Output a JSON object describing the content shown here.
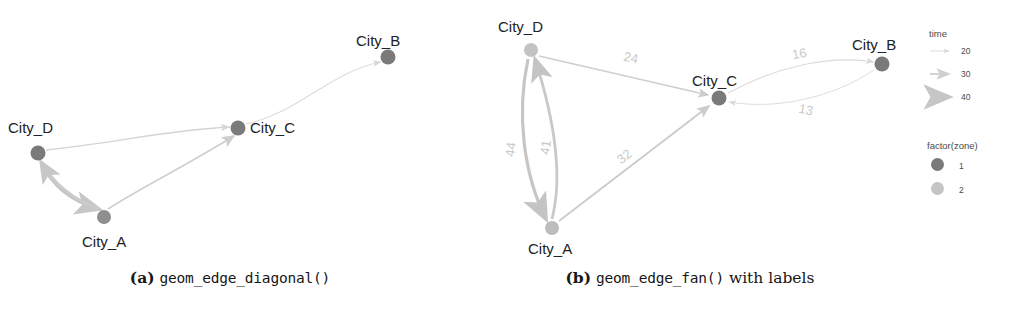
{
  "figure": {
    "background": "#ffffff",
    "panels": [
      {
        "id": "a",
        "caption_prefix": "(a)",
        "caption_code": "geom_edge_diagonal()",
        "caption_suffix": "",
        "nodes": [
          {
            "name": "City_B",
            "label": "City_B",
            "x": 388,
            "y": 57,
            "zone": 1,
            "color": "#7a7a7a",
            "label_x": 356,
            "label_y": 32
          },
          {
            "name": "City_C",
            "label": "City_C",
            "x": 238,
            "y": 128,
            "zone": 1,
            "color": "#7a7a7a",
            "label_x": 250,
            "label_y": 119
          },
          {
            "name": "City_D",
            "label": "City_D",
            "x": 38,
            "y": 153,
            "zone": 1,
            "color": "#7a7a7a",
            "label_x": 8,
            "label_y": 119
          },
          {
            "name": "City_A",
            "label": "City_A",
            "x": 104,
            "y": 217,
            "zone": 1,
            "color": "#8f8f8f",
            "label_x": 82,
            "label_y": 233
          }
        ],
        "edges": [
          {
            "from": "City_C",
            "to": "City_B",
            "time": 16,
            "width": 1.1,
            "color": "#dadada",
            "label": ""
          },
          {
            "from": "City_D",
            "to": "City_C",
            "time": 24,
            "width": 1.3,
            "color": "#d2d2d2",
            "label": ""
          },
          {
            "from": "City_A",
            "to": "City_C",
            "time": 32,
            "width": 1.8,
            "color": "#cfcfcf",
            "label": ""
          },
          {
            "from": "City_D",
            "to": "City_A",
            "time": 44,
            "width": 3.0,
            "color": "#c7c7c7",
            "label": ""
          },
          {
            "from": "City_A",
            "to": "City_D",
            "time": 41,
            "width": 2.6,
            "color": "#cbcbcb",
            "label": ""
          }
        ]
      },
      {
        "id": "b",
        "caption_prefix": "(b)",
        "caption_code": "geom_edge_fan()",
        "caption_suffix": "with labels",
        "nodes": [
          {
            "name": "City_D",
            "label": "City_D",
            "x": 71,
            "y": 50,
            "zone": 2,
            "color": "#c3c3c3",
            "label_x": 38,
            "label_y": 18
          },
          {
            "name": "City_B",
            "label": "City_B",
            "x": 422,
            "y": 64,
            "zone": 1,
            "color": "#7a7a7a",
            "label_x": 392,
            "label_y": 36
          },
          {
            "name": "City_C",
            "label": "City_C",
            "x": 259,
            "y": 98,
            "zone": 1,
            "color": "#7a7a7a",
            "label_x": 232,
            "label_y": 72
          },
          {
            "name": "City_A",
            "label": "City_A",
            "x": 92,
            "y": 228,
            "zone": 2,
            "color": "#bdbdbd",
            "label_x": 68,
            "label_y": 240
          }
        ],
        "edges": [
          {
            "from": "City_D",
            "to": "City_C",
            "time": 24,
            "width": 1.4,
            "color": "#cfcfcf",
            "label": "24",
            "label_x": 170,
            "label_y": 62,
            "label_rot": 12
          },
          {
            "from": "City_C",
            "to": "City_B",
            "time": 16,
            "width": 1.1,
            "color": "#dcdcdc",
            "label": "16",
            "label_x": 340,
            "label_y": 58,
            "label_rot": -10
          },
          {
            "from": "City_B",
            "to": "City_C",
            "time": 13,
            "width": 1.0,
            "color": "#dedede",
            "label": "13",
            "label_x": 345,
            "label_y": 114,
            "label_rot": 12
          },
          {
            "from": "City_A",
            "to": "City_C",
            "time": 32,
            "width": 1.7,
            "color": "#cacaca",
            "label": "32",
            "label_x": 167,
            "label_y": 160,
            "label_rot": -38
          },
          {
            "from": "City_D",
            "to": "City_A",
            "time": 44,
            "width": 3.2,
            "color": "#c6c6c6",
            "label": "44",
            "label_x": 55,
            "label_y": 150,
            "label_rot": -82
          },
          {
            "from": "City_A",
            "to": "City_D",
            "time": 41,
            "width": 2.8,
            "color": "#c9c9c9",
            "label": "41",
            "label_x": 90,
            "label_y": 148,
            "label_rot": -82
          }
        ]
      }
    ]
  },
  "legend": {
    "time": {
      "title": "time",
      "keys": [
        {
          "value": "20",
          "width": 0.9,
          "head": 5.0,
          "color": "#d8d8d8"
        },
        {
          "value": "30",
          "width": 1.8,
          "head": 6.5,
          "color": "#cfcfcf"
        },
        {
          "value": "40",
          "width": 3.2,
          "head": 8.0,
          "color": "#c6c6c6"
        }
      ]
    },
    "zone": {
      "title": "factor(zone)",
      "keys": [
        {
          "value": "1",
          "color": "#7a7a7a",
          "size": 11
        },
        {
          "value": "2",
          "color": "#c4c4c4",
          "size": 11
        }
      ]
    }
  }
}
